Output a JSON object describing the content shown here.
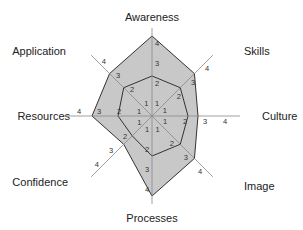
{
  "chart_data": {
    "type": "radar",
    "title": "",
    "axes": [
      "Awareness",
      "Skills",
      "Culture",
      "Image",
      "Processes",
      "Confidence",
      "Resources",
      "Application"
    ],
    "scale": {
      "min": 0,
      "max": 4,
      "ticks": [
        1,
        2,
        3,
        4
      ]
    },
    "series": [
      {
        "name": "outer",
        "values": [
          4,
          3,
          2.3,
          3,
          4,
          2,
          3,
          3
        ],
        "fill": "#c8c8c8",
        "stroke": "#333333"
      },
      {
        "name": "inner",
        "values": [
          2,
          2,
          1.8,
          2,
          2,
          1.4,
          1.7,
          2
        ],
        "fill": "none",
        "stroke": "#333333"
      }
    ],
    "grid": false,
    "legend": "none"
  },
  "colors": {
    "fill": "#c8c8c8",
    "line": "#333333",
    "axis": "#888888"
  }
}
